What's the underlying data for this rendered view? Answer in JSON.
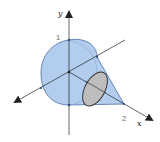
{
  "figure": {
    "axes": {
      "y_label": "y",
      "x_label": "x",
      "y_tick_label": "1",
      "x_tick_label": "2"
    },
    "colors": {
      "solid_fill": "#b3cdee",
      "solid_stroke": "#4a6fa5",
      "cross_section_fill": "#bdbdbd",
      "cross_section_stroke": "#2b2b2b",
      "axis": "#222222"
    }
  }
}
